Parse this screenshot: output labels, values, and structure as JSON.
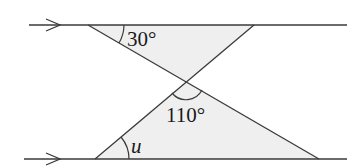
{
  "diagram": {
    "type": "geometry-parallel-lines",
    "colors": {
      "line": "#3a3a3a",
      "fill": "#efefef",
      "text": "#1a1a1a"
    },
    "parallel_lines": [
      {
        "name": "top-line",
        "y": 25,
        "x1": 29,
        "x2": 347,
        "arrow_tip_x": 60
      },
      {
        "name": "bottom-line",
        "y": 159,
        "x1": 24,
        "x2": 347,
        "arrow_tip_x": 60
      }
    ],
    "intersection": {
      "x": 186,
      "y": 81
    },
    "upper_triangle": [
      [
        88,
        25
      ],
      [
        254,
        25
      ],
      [
        186,
        81
      ]
    ],
    "lower_triangle": [
      [
        186,
        81
      ],
      [
        95,
        159
      ],
      [
        319,
        159
      ]
    ],
    "labels": {
      "angle_top": "30°",
      "angle_middle": "110°",
      "angle_bottom": "u"
    }
  }
}
